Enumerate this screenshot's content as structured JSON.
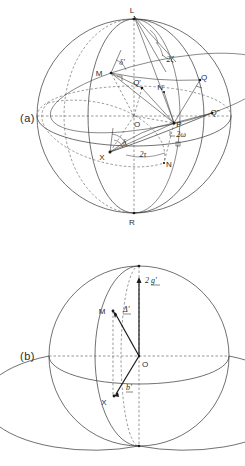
{
  "figure": {
    "background_color": "#ffffff",
    "line_color": "#333333",
    "text_color": "#2b2b2b"
  },
  "panels": [
    {
      "tag": "(a)",
      "tag_x": 20,
      "tag_y": 122,
      "sphere": {
        "cx": 134,
        "cy": 116,
        "r": 97
      },
      "points": [
        {
          "name": "L",
          "label": "L",
          "x": 134,
          "y": 16,
          "lx": 132,
          "ly": 13
        },
        {
          "name": "M",
          "label": "M",
          "x": 111,
          "y": 73,
          "lx": 99,
          "ly": 76
        },
        {
          "name": "Q-prime",
          "label": "Q'",
          "x": 142,
          "y": 88,
          "lx": 137,
          "ly": 85
        },
        {
          "name": "N-prime",
          "label": "N'",
          "x": 164,
          "y": 92,
          "lx": 160,
          "ly": 90
        },
        {
          "name": "Q",
          "label": "Q",
          "x": 200,
          "y": 80,
          "lx": 203,
          "ly": 80
        },
        {
          "name": "Q-double-prime",
          "label": "Q\"",
          "x": 212,
          "y": 113,
          "lx": 213,
          "ly": 114
        },
        {
          "name": "O",
          "label": "O",
          "x": 134,
          "y": 116,
          "lx": 136,
          "ly": 126
        },
        {
          "name": "P",
          "label": "P",
          "x": 174,
          "y": 123,
          "lx": 178,
          "ly": 126
        },
        {
          "name": "X",
          "label": "X",
          "x": 110,
          "y": 152,
          "lx": 102,
          "ly": 159
        },
        {
          "name": "N",
          "label": "N",
          "x": 164,
          "y": 163,
          "lx": 167,
          "ly": 166
        },
        {
          "name": "R",
          "label": "R",
          "x": 134,
          "y": 216,
          "lx": 132,
          "ly": 224
        }
      ],
      "angles": [
        {
          "name": "delta-prime-upper",
          "label": "δ'",
          "x": 122,
          "y": 65
        },
        {
          "name": "two-zeta",
          "label": "2ζ",
          "x": 169,
          "y": 61
        },
        {
          "name": "delta-lower",
          "label": "δ",
          "x": 123,
          "y": 144
        },
        {
          "name": "two-omega",
          "label": "2ω",
          "x": 178,
          "y": 136
        },
        {
          "name": "two-tau",
          "label": "2τ",
          "x": 142,
          "y": 155
        }
      ]
    },
    {
      "tag": "(b)",
      "tag_x": 20,
      "tag_y": 355,
      "sphere": {
        "cx": 139,
        "cy": 356,
        "r": 90
      },
      "points": [
        {
          "name": "top-pole",
          "label": "",
          "x": 139,
          "y": 266,
          "lx": 0,
          "ly": 0
        },
        {
          "name": "M",
          "label": "M",
          "x": 113,
          "y": 311,
          "lx": 101,
          "ly": 313
        },
        {
          "name": "O",
          "label": "O",
          "x": 139,
          "y": 356,
          "lx": 143,
          "ly": 366
        },
        {
          "name": "X",
          "label": "X",
          "x": 114,
          "y": 396,
          "lx": 104,
          "ly": 404
        },
        {
          "name": "bottom-pole",
          "label": "",
          "x": 139,
          "y": 446,
          "lx": 0,
          "ly": 0
        }
      ],
      "vector_tip": {
        "x": 139,
        "y": 279
      },
      "labels": [
        {
          "name": "two-g-prime",
          "label": "2 g'",
          "x": 145,
          "y": 281,
          "vector": true
        },
        {
          "name": "delta-prime-b",
          "label": "Δ'",
          "x": 124,
          "y": 310,
          "vector": true
        },
        {
          "name": "b-prime",
          "label": "b'",
          "x": 128,
          "y": 389,
          "vector": true
        }
      ]
    }
  ]
}
